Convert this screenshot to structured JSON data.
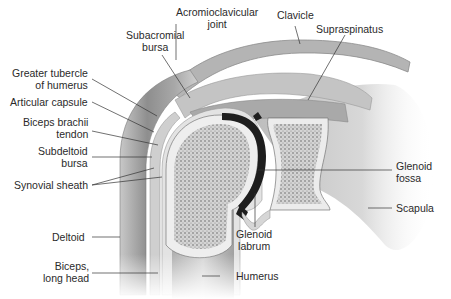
{
  "diagram": {
    "colors": {
      "background": "#ffffff",
      "label_text": "#2a2a2a",
      "leader_line": "#333333",
      "muscle": "#9a9a9a",
      "bone_marrow": "#8a8a8a",
      "cartilage": "#e6e6e6",
      "joint_cavity": "#1e1e1e"
    },
    "labels": {
      "acromioclavicular_joint": "Acromioclavicular\njoint",
      "clavicle": "Clavicle",
      "supraspinatus": "Supraspinatus",
      "subacromial_bursa": "Subacromial\nbursa",
      "greater_tubercle": "Greater tubercle\nof humerus",
      "articular_capsule": "Articular capsule",
      "biceps_brachii_tendon": "Biceps brachii\ntendon",
      "subdeltoid_bursa": "Subdeltoid\nbursa",
      "synovial_sheath": "Synovial sheath",
      "glenoid_fossa": "Glenoid\nfossa",
      "scapula": "Scapula",
      "glenoid_labrum": "Glenoid\nlabrum",
      "deltoid": "Deltoid",
      "biceps_long_head": "Biceps,\nlong head",
      "humerus": "Humerus"
    }
  }
}
